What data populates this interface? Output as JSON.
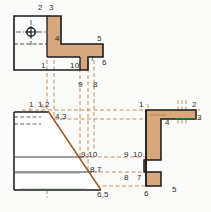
{
  "drawing": {
    "title": "Orthographic projection worksheet with numbered vertices",
    "colors": {
      "fill": "#d7a77e",
      "fill_light": "#e2b894",
      "outline": "#1a1a1a",
      "projection": "#b5601f",
      "label": "#2b2b2b",
      "paper": "#fbfbf9",
      "green_edge": "#2f7d3a",
      "violet_edge": "#6a4f8f"
    },
    "views": {
      "top": {
        "name": "top-view",
        "label": "Top view (L-shaped plan)"
      },
      "front": {
        "name": "front-view",
        "label": "Front view (wedge with diagonal)"
      },
      "side": {
        "name": "side-view",
        "label": "Side view (stepped profile)"
      }
    }
  },
  "labels": {
    "top_view": [
      {
        "id": "tv-2",
        "text": "2",
        "x": 38,
        "y": 4
      },
      {
        "id": "tv-3",
        "text": "3",
        "x": 49,
        "y": 4
      },
      {
        "id": "tv-4",
        "text": "4",
        "x": 55,
        "y": 35
      },
      {
        "id": "tv-5",
        "text": "5",
        "x": 97,
        "y": 35
      },
      {
        "id": "tv-7",
        "text": "7",
        "x": 90,
        "y": 56
      },
      {
        "id": "tv-6",
        "text": "6",
        "x": 102,
        "y": 60
      },
      {
        "id": "tv-1",
        "text": "1",
        "x": 41,
        "y": 67
      },
      {
        "id": "tv-10",
        "text": "10",
        "x": 71,
        "y": 67
      },
      {
        "id": "tv-9",
        "text": "9",
        "x": 78,
        "y": 84
      },
      {
        "id": "tv-8",
        "text": "8",
        "x": 94,
        "y": 84
      }
    ],
    "front_view": [
      {
        "id": "fv-1-2",
        "text": "1,2",
        "x": 38,
        "y": 105
      },
      {
        "id": "fv-tick",
        "text": "1",
        "x": 29,
        "y": 105
      },
      {
        "id": "fv-4-3",
        "text": "4,3",
        "x": 55,
        "y": 116
      },
      {
        "id": "fv-9-10",
        "text": "9,10",
        "x": 81,
        "y": 155
      },
      {
        "id": "fv-8-7",
        "text": "8,7",
        "x": 91,
        "y": 170
      },
      {
        "id": "fv-6-5",
        "text": "6,5",
        "x": 98,
        "y": 190
      }
    ],
    "side_view": [
      {
        "id": "sv-1",
        "text": "1",
        "x": 139,
        "y": 105
      },
      {
        "id": "sv-2",
        "text": "2",
        "x": 193,
        "y": 105
      },
      {
        "id": "sv-3",
        "text": "3",
        "x": 196,
        "y": 119
      },
      {
        "id": "sv-4",
        "text": "4",
        "x": 167,
        "y": 122
      },
      {
        "id": "sv-9",
        "text": "9",
        "x": 124,
        "y": 155
      },
      {
        "id": "sv-10",
        "text": "10",
        "x": 134,
        "y": 155
      },
      {
        "id": "sv-8",
        "text": "8",
        "x": 124,
        "y": 178
      },
      {
        "id": "sv-7",
        "text": "7",
        "x": 138,
        "y": 178
      },
      {
        "id": "sv-6",
        "text": "6",
        "x": 144,
        "y": 192
      },
      {
        "id": "sv-5",
        "text": "5",
        "x": 172,
        "y": 188
      }
    ]
  },
  "geometry": {
    "top_view": {
      "outline": "M14,16 L61,16 L61,44 L103,44 L103,57 L88,57 L88,70 L14,70 Z",
      "fill_vertical_strip": "M47,16 L61,16 L61,44 L47,44 Z",
      "fill_horizontal_arm": "M47,44 L103,44 L103,57 L88,57 L88,57 L47,57 Z",
      "fill_small_step": "M80,57 L88,57 L88,70 L80,70 Z",
      "circle_center": {
        "cx": 31,
        "cy": 32,
        "r": 4
      },
      "hidden_horizontal_y": 44
    },
    "front_view": {
      "outline": "M14,112 L48,112 L101,190 L14,190 Z",
      "horizontal_edges_y": [
        157,
        172,
        190
      ],
      "diagonal": {
        "x1": 48,
        "y1": 112,
        "x2": 101,
        "y2": 190
      },
      "hidden_box": {
        "x": 14,
        "y": 112,
        "w": 26,
        "h": 12
      }
    },
    "side_view": {
      "outline": "M146,110 L196,110 L196,119 L161,119 L161,160 L144,160 L144,172 L161,172 L161,186 L146,186 Z"
    },
    "projection_lines": {
      "vertical_x": [
        47,
        54,
        80,
        88,
        94
      ],
      "horizontal_y": [
        110,
        119,
        157,
        172,
        186
      ]
    }
  }
}
